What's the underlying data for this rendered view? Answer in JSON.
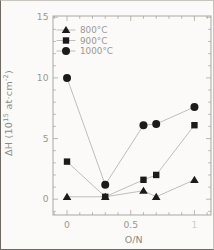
{
  "figure": {
    "background": "#fbfaf8",
    "frame_color": "#a9a7a1",
    "line_color": "#b9b7b2",
    "marker_color": "#1b1b1b",
    "text_color": "#9b9892",
    "axis_label_color": "#8e8b86"
  },
  "ylabel": {
    "p1": "ΔH (10",
    "s1": "15",
    "p2": " at·cm",
    "s2": "-2",
    "p3": ")"
  },
  "chart_data": {
    "type": "line",
    "title": "",
    "xlabel": "O/N",
    "ylabel": "ΔH (10^15 at·cm^-2)",
    "x": [
      0,
      0.3,
      0.6,
      0.7,
      1.0
    ],
    "series": [
      {
        "name": "800°C",
        "marker": "triangle",
        "values": [
          0.2,
          0.2,
          0.7,
          0.2,
          1.6
        ]
      },
      {
        "name": "900°C",
        "marker": "square",
        "values": [
          3.1,
          0.2,
          1.6,
          2.0,
          6.1
        ]
      },
      {
        "name": "1000°C",
        "marker": "circle",
        "values": [
          10.0,
          1.2,
          6.1,
          6.2,
          7.6
        ]
      }
    ],
    "xlim": [
      -0.11,
      1.13
    ],
    "ylim": [
      -1.3,
      15.1
    ],
    "x_major_ticks": [
      0,
      0.5,
      1
    ],
    "x_tick_labels": [
      "0",
      "0.5",
      "1"
    ],
    "x_minor_step": 0.1,
    "y_major_ticks": [
      0,
      5,
      10,
      15
    ],
    "y_tick_labels": [
      "0",
      "5",
      "10",
      "15"
    ],
    "y_minor_step": 1,
    "grid": false,
    "legend_position": "top-left"
  }
}
